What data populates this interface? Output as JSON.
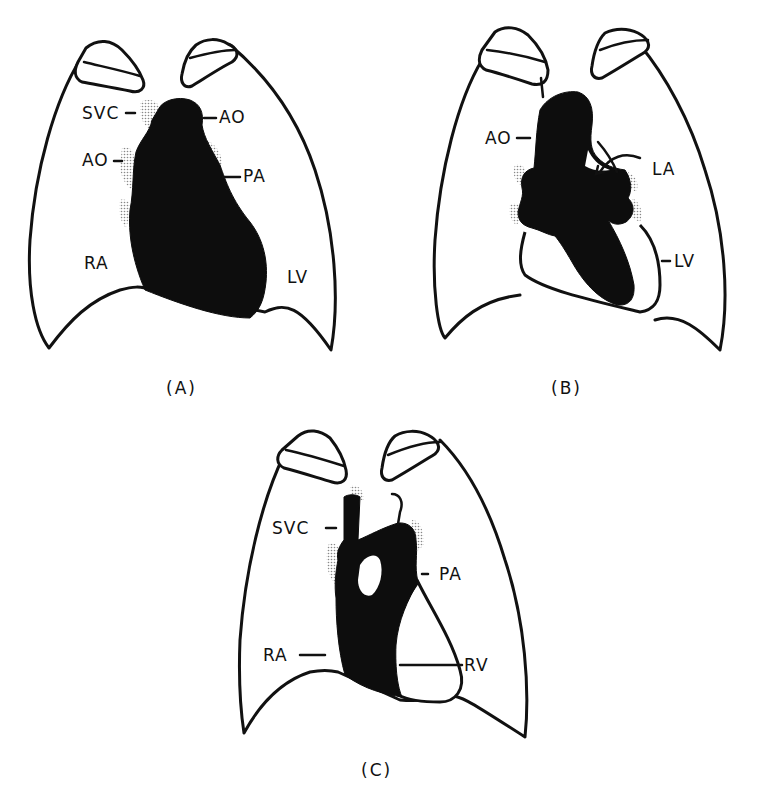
{
  "figure": {
    "type": "chest-radiograph-schematic",
    "panels": [
      {
        "id": "A",
        "caption": "(A)",
        "labels": {
          "svc": "SVC",
          "ao_left": "AO",
          "ao_right": "AO",
          "pa": "PA",
          "ra": "RA",
          "lv": "LV"
        }
      },
      {
        "id": "B",
        "caption": "(B)",
        "labels": {
          "ao": "AO",
          "la": "LA",
          "lv": "LV"
        }
      },
      {
        "id": "C",
        "caption": "(C)",
        "labels": {
          "svc": "SVC",
          "pa": "PA",
          "ra": "RA",
          "rv": "RV"
        }
      }
    ]
  },
  "colors": {
    "ink": "#111111",
    "fill": "#0d0d0d",
    "background": "#ffffff"
  }
}
